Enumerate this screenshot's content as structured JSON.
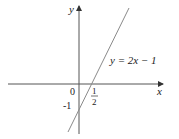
{
  "diagram": {
    "type": "function-graph",
    "axes": {
      "x_label": "x",
      "y_label": "y"
    },
    "origin_label": "0",
    "y_intercept_label": "-1",
    "x_intercept_label": {
      "numerator": "1",
      "denominator": "2"
    },
    "line": {
      "equation_label": "y = 2x − 1",
      "slope": 2,
      "intercept": -1,
      "color": "#8a8a8a"
    },
    "axis_color": "#444444"
  }
}
